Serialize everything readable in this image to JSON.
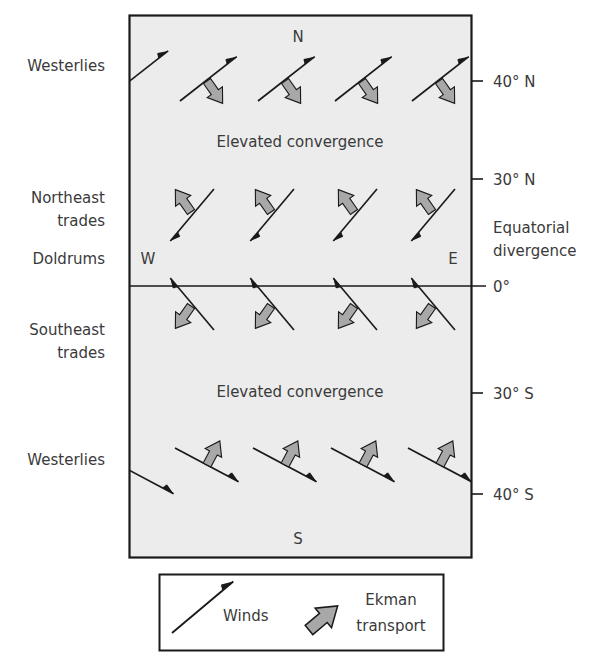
{
  "diagram": {
    "title": "",
    "compass": {
      "north": "N",
      "south": "S",
      "west": "W",
      "east": "E"
    },
    "left_labels": {
      "westerlies_north": "Westerlies",
      "northeast_trades_line1": "Northeast",
      "northeast_trades_line2": "trades",
      "doldrums": "Doldrums",
      "southeast_trades_line1": "Southeast",
      "southeast_trades_line2": "trades",
      "westerlies_south": "Westerlies"
    },
    "right_labels": {
      "lat_40n": "40° N",
      "lat_30n": "30° N",
      "equatorial_line1": "Equatorial",
      "equatorial_line2": "divergence",
      "lat_0": "0°",
      "lat_30s": "30° S",
      "lat_40s": "40° S"
    },
    "inner_labels": {
      "convergence_north": "Elevated convergence",
      "convergence_south": "Elevated convergence"
    },
    "legend": {
      "winds": "Winds",
      "ekman_line1": "Ekman",
      "ekman_line2": "transport"
    },
    "colors": {
      "panel_bg": "#ececec",
      "ekman_fill": "#a8a8a8",
      "line": "#1a1a1a",
      "text": "#3a3a3a"
    }
  }
}
